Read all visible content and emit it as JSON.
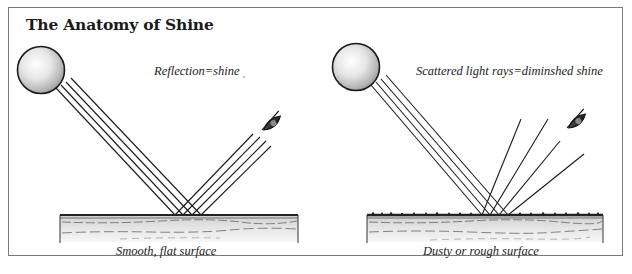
{
  "title": "The Anatomy of Shine",
  "panels": [
    {
      "id": "smooth",
      "heading": "Reflection=shine",
      "surface_label": "Smooth, flat surface",
      "light_source": "sphere-light",
      "viewer": "eye-icon",
      "ray_behavior": "parallel reflection"
    },
    {
      "id": "rough",
      "heading": "Scattered light rays=diminshed shine",
      "surface_label": "Dusty or rough surface",
      "light_source": "sphere-light",
      "viewer": "eye-icon",
      "ray_behavior": "scattered reflection"
    }
  ],
  "colors": {
    "frame": "#7a7a7a",
    "ink": "#1a1a1a",
    "surface_fill": "#d9d9d9",
    "surface_top": "#333333"
  }
}
